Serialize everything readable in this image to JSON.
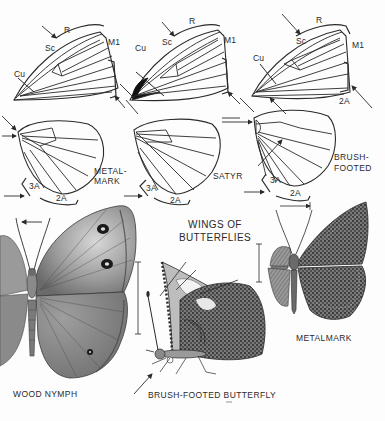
{
  "figure": {
    "title_line1": "WINGS OF",
    "title_line2": "BUTTERFLIES",
    "colors": {
      "ink": "#2a2a2a",
      "paper": "#fdfdfd",
      "wing_shade": "#8a8a8a",
      "wing_dark": "#4a4a4a"
    }
  },
  "wing_diagrams": [
    {
      "family": "metalmark",
      "label_line1": "METAL-",
      "label_line2": "MARK",
      "forewing_veins": {
        "r": "R",
        "sc": "Sc",
        "m1": "M1",
        "cu": "Cu"
      },
      "hindwing_veins": {
        "a3": "3A",
        "a2": "2A"
      }
    },
    {
      "family": "satyr",
      "label_line1": "SATYR",
      "forewing_veins": {
        "r": "R",
        "sc": "Sc",
        "m1": "M1",
        "cu": "Cu"
      },
      "hindwing_veins": {
        "a3": "3A",
        "a2": "2A"
      }
    },
    {
      "family": "brush-footed",
      "label_line1": "BRUSH-",
      "label_line2": "FOOTED",
      "forewing_veins": {
        "r": "R",
        "sc": "Sc",
        "m1": "M1",
        "cu": "Cu",
        "a2": "2A"
      },
      "hindwing_veins": {
        "a3": "3A",
        "a2": "2A"
      }
    }
  ],
  "specimens": [
    {
      "name": "WOOD NYMPH"
    },
    {
      "name": "BRUSH-FOOTED BUTTERFLY"
    },
    {
      "name": "METALMARK"
    }
  ]
}
